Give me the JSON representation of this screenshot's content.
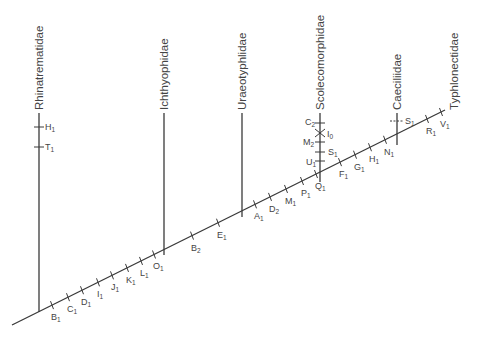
{
  "figure": {
    "type": "cladogram",
    "title": ""
  },
  "taxa": [
    {
      "name": "Rhinatrematidae",
      "x": 39
    },
    {
      "name": "Ichthyophidae",
      "x": 164
    },
    {
      "name": "Uraeotyphlidae",
      "x": 242
    },
    {
      "name": "Scolecomorphidae",
      "x": 320
    },
    {
      "name": "Caeciliidae",
      "x": 397
    },
    {
      "name": "Typhlonectidae",
      "x": 445
    }
  ],
  "stem_characters": [
    {
      "letter": "B",
      "sub": "1"
    },
    {
      "letter": "C",
      "sub": "1"
    },
    {
      "letter": "D",
      "sub": "1"
    },
    {
      "letter": "I",
      "sub": "1"
    },
    {
      "letter": "J",
      "sub": "1"
    },
    {
      "letter": "K",
      "sub": "1"
    },
    {
      "letter": "L",
      "sub": "1"
    },
    {
      "letter": "O",
      "sub": "1"
    },
    {
      "letter": "B",
      "sub": "2"
    },
    {
      "letter": "E",
      "sub": "1"
    },
    {
      "letter": "A",
      "sub": "1"
    },
    {
      "letter": "D",
      "sub": "2"
    },
    {
      "letter": "M",
      "sub": "1"
    },
    {
      "letter": "P",
      "sub": "1"
    },
    {
      "letter": "Q",
      "sub": "1"
    },
    {
      "letter": "F",
      "sub": "1"
    },
    {
      "letter": "G",
      "sub": "1"
    },
    {
      "letter": "H",
      "sub": "1"
    },
    {
      "letter": "N",
      "sub": "1"
    },
    {
      "letter": "R",
      "sub": "1"
    },
    {
      "letter": "V",
      "sub": "1"
    }
  ],
  "branch_characters": {
    "Rhinatrematidae": [
      {
        "letter": "H",
        "sub": "1"
      },
      {
        "letter": "T",
        "sub": "1"
      }
    ],
    "Scolecomorphidae": [
      {
        "letter": "C",
        "sub": "2"
      },
      {
        "letter": "I",
        "sub": "0",
        "style": "reversal-x"
      },
      {
        "letter": "M",
        "sub": "2"
      },
      {
        "letter": "S",
        "sub": "1"
      },
      {
        "letter": "U",
        "sub": "1"
      }
    ],
    "Caeciliidae": [
      {
        "letter": "S",
        "sub": "1",
        "style": "dashed"
      }
    ]
  }
}
